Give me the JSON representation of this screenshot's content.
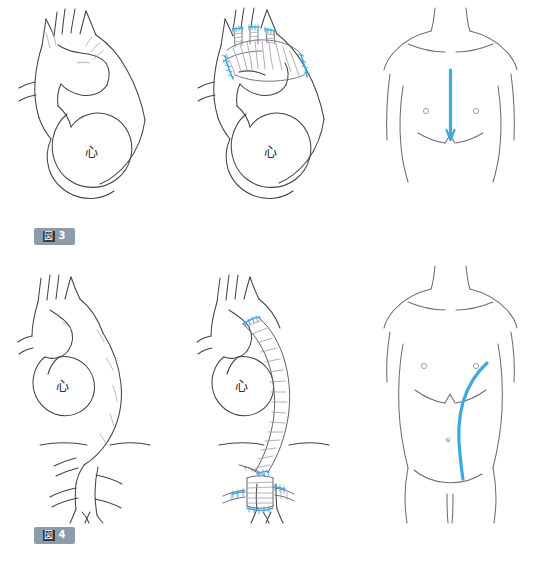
{
  "document": {
    "title": "大動脈手術の術式と皮膚切開",
    "language": "ja",
    "background_color": "#ffffff"
  },
  "colors": {
    "outline": "#3f3f46",
    "outline_light": "#9a9a9f",
    "suture_blue": "#3fa9dd",
    "incision_blue": "#3fa9dd",
    "badge_background": "#8d9cab",
    "badge_kanji_background": "#2f3a44",
    "badge_text": "#ffffff",
    "graft_shading": "#8b8b90"
  },
  "figures": [
    {
      "id": "fig3",
      "badge": {
        "kanji": "図",
        "number": "3"
      },
      "panels": [
        {
          "id": "fig3-pre",
          "name": "aortic-arch-aneurysm-preop",
          "heart_label": "心",
          "branch_count": 3
        },
        {
          "id": "fig3-post",
          "name": "total-arch-replacement-graft",
          "heart_label": "心",
          "branch_count": 3,
          "suture_lines": 5
        },
        {
          "id": "fig3-body",
          "name": "median-sternotomy-incision",
          "incision": "median sternotomy",
          "nipple_markers": 2
        }
      ]
    },
    {
      "id": "fig4",
      "badge": {
        "kanji": "図",
        "number": "4"
      },
      "panels": [
        {
          "id": "fig4-pre",
          "name": "thoracoabdominal-aortic-aneurysm-preop",
          "heart_label": "心",
          "branch_count": 4
        },
        {
          "id": "fig4-post",
          "name": "thoracoabdominal-graft-replacement",
          "heart_label": "心",
          "branch_count": 4,
          "suture_lines": 6
        },
        {
          "id": "fig4-body",
          "name": "thoracoabdominal-incision",
          "incision": "left thoracoabdominal",
          "nipple_markers": 2,
          "navel_marker": 1
        }
      ]
    }
  ]
}
